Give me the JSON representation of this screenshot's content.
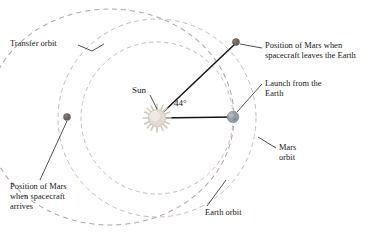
{
  "figure": {
    "type": "diagram",
    "background_color": "#ffffff",
    "line_color": "#141414",
    "orbit_dash_color": "#b9a9b0",
    "sun_color": "#cfc3b4",
    "earth_color": "#8d9aa6",
    "mars_color": "#6e6158"
  },
  "labels": {
    "transfer_orbit": "Transfer orbit",
    "sun": "Sun",
    "angle": "44°",
    "mars_at_launch": "Position of Mars when\nspacecraft leaves the Earth",
    "launch": "Launch from the\nEarth",
    "mars_orbit": "Mars\norbit",
    "earth_orbit": "Earth orbit",
    "mars_at_arrival": "Position of Mars\nwhen spacecraft\narrives"
  },
  "bodies": [
    {
      "name": "sun",
      "label": "Sun",
      "x": 157,
      "y": 118,
      "r": 9
    },
    {
      "name": "earth",
      "label": "Launch from the Earth",
      "x": 233,
      "y": 117,
      "r": 5.6
    },
    {
      "name": "mars-at-launch",
      "label": "Position of Mars when spacecraft leaves the Earth",
      "x": 236,
      "y": 42,
      "r": 3.6
    },
    {
      "name": "mars-at-arrival",
      "label": "Position of Mars when spacecraft arrives",
      "x": 67,
      "y": 117,
      "r": 3.6
    }
  ],
  "orbits": [
    {
      "name": "earth-orbit",
      "shape": "circle",
      "cx": 157,
      "cy": 118,
      "r": 76,
      "style": "dashed"
    },
    {
      "name": "mars-orbit",
      "shape": "circle",
      "cx": 157,
      "cy": 118,
      "r": 99,
      "style": "dashed"
    },
    {
      "name": "transfer-orbit",
      "shape": "ellipse",
      "cx": 110,
      "cy": 117,
      "rx": 123,
      "ry": 107,
      "style": "dashed"
    }
  ],
  "angle": {
    "value_degrees": 44,
    "display": "44°",
    "from": "sun-earth-line",
    "to": "sun-mars-line"
  }
}
